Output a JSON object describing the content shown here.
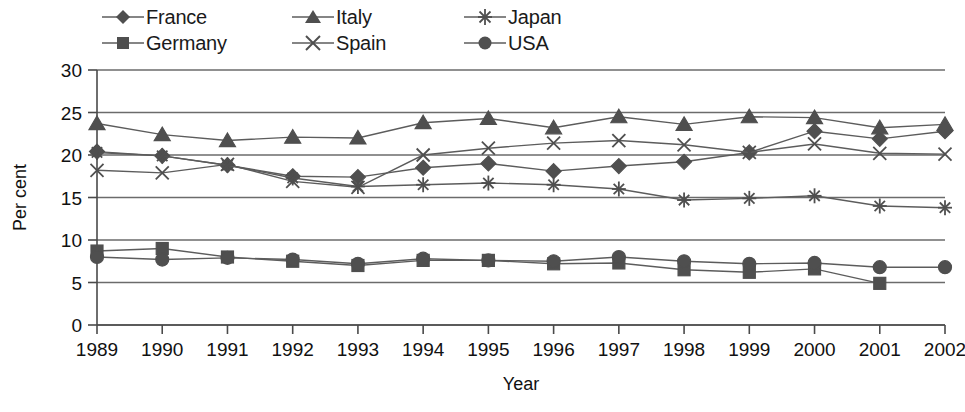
{
  "legend": {
    "rows": [
      [
        {
          "label": "France",
          "symbol": "diamond"
        },
        {
          "label": "Italy",
          "symbol": "triangle"
        },
        {
          "label": "Japan",
          "symbol": "asterisk"
        }
      ],
      [
        {
          "label": "Germany",
          "symbol": "square"
        },
        {
          "label": "Spain",
          "symbol": "cross-x"
        },
        {
          "label": "USA",
          "symbol": "circle"
        }
      ]
    ]
  },
  "chart_data": {
    "type": "line",
    "title": "",
    "xlabel": "Year",
    "ylabel": "Per cent",
    "grid": true,
    "legend_position": "top",
    "categories": [
      "1989",
      "1990",
      "1991",
      "1992",
      "1993",
      "1994",
      "1995",
      "1996",
      "1997",
      "1998",
      "1999",
      "2000",
      "2001",
      "2002"
    ],
    "x": [
      1989,
      1990,
      1991,
      1992,
      1993,
      1994,
      1995,
      1996,
      1997,
      1998,
      1999,
      2000,
      2001,
      2002
    ],
    "xlim": [
      1989,
      2002
    ],
    "ylim": [
      0,
      30
    ],
    "yticks": [
      0,
      5,
      10,
      15,
      20,
      25,
      30
    ],
    "series": [
      {
        "name": "France",
        "symbol": "diamond",
        "values": [
          20.4,
          19.9,
          18.8,
          17.5,
          17.4,
          18.5,
          19.0,
          18.1,
          18.7,
          19.2,
          20.3,
          22.8,
          21.9,
          22.8
        ]
      },
      {
        "name": "Germany",
        "symbol": "square",
        "values": [
          8.7,
          9.0,
          8.0,
          7.5,
          7.0,
          7.6,
          7.6,
          7.2,
          7.3,
          6.5,
          6.2,
          6.6,
          4.9,
          null
        ]
      },
      {
        "name": "Italy",
        "symbol": "triangle",
        "values": [
          23.7,
          22.4,
          21.7,
          22.1,
          22.0,
          23.8,
          24.3,
          23.2,
          24.5,
          23.6,
          24.5,
          24.4,
          23.2,
          23.6
        ]
      },
      {
        "name": "Spain",
        "symbol": "cross-x",
        "values": [
          18.2,
          17.9,
          18.9,
          16.9,
          16.2,
          20.0,
          20.8,
          21.4,
          21.7,
          21.2,
          20.3,
          21.3,
          20.2,
          20.1
        ]
      },
      {
        "name": "Japan",
        "symbol": "asterisk",
        "values": [
          20.3,
          19.9,
          18.8,
          17.3,
          16.3,
          16.5,
          16.7,
          16.5,
          16.0,
          14.7,
          14.9,
          15.2,
          14.0,
          13.8
        ]
      },
      {
        "name": "USA",
        "symbol": "circle",
        "values": [
          8.0,
          7.7,
          7.9,
          7.7,
          7.2,
          7.8,
          7.6,
          7.5,
          8.0,
          7.5,
          7.2,
          7.3,
          6.8,
          6.8
        ]
      }
    ]
  }
}
